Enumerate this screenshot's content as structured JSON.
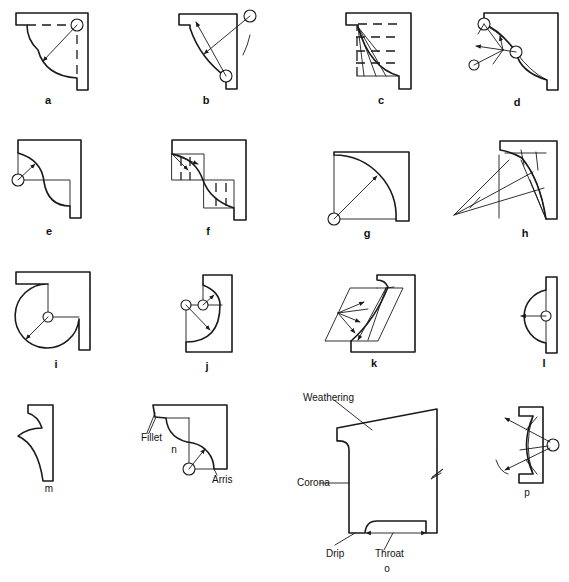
{
  "figure": {
    "panels": [
      {
        "id": "a",
        "label": "a",
        "x": 48,
        "y": 101
      },
      {
        "id": "b",
        "label": "b",
        "x": 206,
        "y": 101
      },
      {
        "id": "c",
        "label": "c",
        "x": 381,
        "y": 101
      },
      {
        "id": "d",
        "label": "d",
        "x": 517,
        "y": 103
      },
      {
        "id": "e",
        "label": "e",
        "x": 49,
        "y": 232
      },
      {
        "id": "f",
        "label": "f",
        "x": 208,
        "y": 232
      },
      {
        "id": "g",
        "label": "g",
        "x": 367,
        "y": 234
      },
      {
        "id": "h",
        "label": "h",
        "x": 525,
        "y": 234
      },
      {
        "id": "i",
        "label": "i",
        "x": 56,
        "y": 365
      },
      {
        "id": "j",
        "label": "j",
        "x": 207,
        "y": 367
      },
      {
        "id": "k",
        "label": "k",
        "x": 374,
        "y": 364
      },
      {
        "id": "l",
        "label": "l",
        "x": 544,
        "y": 364
      },
      {
        "id": "m",
        "label": "m",
        "x": 49,
        "y": 483
      },
      {
        "id": "n",
        "label": "n",
        "x": 174,
        "y": 444
      },
      {
        "id": "o",
        "label": "o",
        "x": 387,
        "y": 570
      },
      {
        "id": "p",
        "label": "p",
        "x": 527,
        "y": 494
      }
    ],
    "annotations": {
      "weathering": "Weathering",
      "corona": "Corona",
      "drip": "Drip",
      "throat": "Throat",
      "fillet": "Fillet",
      "arris": "Arris"
    }
  }
}
